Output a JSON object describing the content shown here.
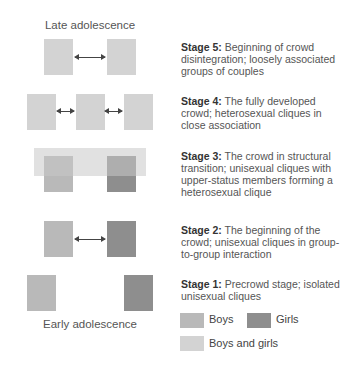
{
  "labels": {
    "top": "Late adolescence",
    "bottom": "Early adolescence"
  },
  "stages": [
    {
      "title": "Stage 5:",
      "text": " Beginning of crowd disintegration; loosely associated groups of couples"
    },
    {
      "title": "Stage 4:",
      "text": " The fully developed crowd; heterosexual cliques in close association"
    },
    {
      "title": "Stage 3:",
      "text": " The crowd in structural transition; unisexual cliques with upper-status members forming a heterosexual clique"
    },
    {
      "title": "Stage 2:",
      "text": " The beginning of the crowd; unisexual cliques in group-to-group interaction"
    },
    {
      "title": "Stage 1:",
      "text": " Precrowd stage; isolated unisexual cliques"
    }
  ],
  "legend": {
    "boys": "Boys",
    "girls": "Girls",
    "mixed": "Boys and girls"
  },
  "colors": {
    "boys": "#b9b9b9",
    "girls": "#8e8e8e",
    "mixed": "#d3d3d3"
  }
}
